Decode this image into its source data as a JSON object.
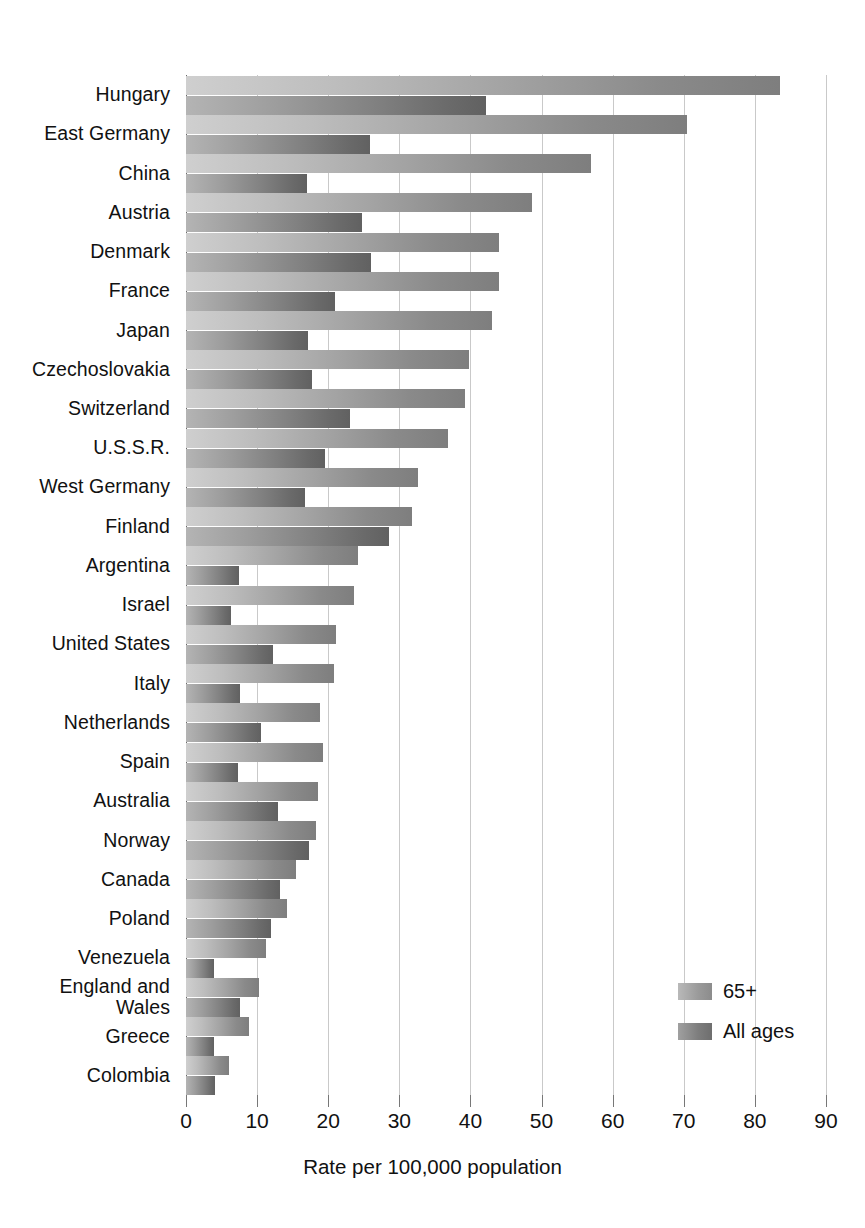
{
  "chart_data": {
    "type": "bar",
    "orientation": "horizontal",
    "title": "",
    "xlabel": "Rate per 100,000 population",
    "ylabel": "",
    "xlim": [
      0,
      90
    ],
    "xticks": [
      0,
      10,
      20,
      30,
      40,
      50,
      60,
      70,
      80,
      90
    ],
    "xtick_labels": [
      "0",
      "10",
      "20",
      "30",
      "40",
      "50",
      "60",
      "70",
      "80",
      "90"
    ],
    "grid": true,
    "legend_position": "bottom-right",
    "categories": [
      "Hungary",
      "East Germany",
      "China",
      "Austria",
      "Denmark",
      "France",
      "Japan",
      "Czechoslovakia",
      "Switzerland",
      "U.S.S.R.",
      "West Germany",
      "Finland",
      "Argentina",
      "Israel",
      "United States",
      "Italy",
      "Netherlands",
      "Spain",
      "Australia",
      "Norway",
      "Canada",
      "Poland",
      "Venezuela",
      "England and\nWales",
      "Greece",
      "Colombia"
    ],
    "series": [
      {
        "name": "65+",
        "color": "#a2a2a2",
        "values": [
          83.5,
          70.5,
          57.0,
          48.7,
          44.0,
          44.0,
          43.0,
          39.8,
          39.2,
          36.8,
          32.6,
          31.8,
          24.2,
          23.6,
          21.1,
          20.8,
          18.9,
          19.2,
          18.6,
          18.3,
          15.4,
          14.2,
          11.2,
          10.3,
          8.8,
          6.0
        ]
      },
      {
        "name": "All ages",
        "color": "#7f7f7f",
        "values": [
          42.2,
          25.9,
          17.0,
          24.8,
          26.0,
          21.0,
          17.1,
          17.7,
          23.1,
          19.5,
          16.7,
          28.6,
          7.5,
          6.3,
          12.2,
          7.6,
          10.5,
          7.3,
          12.9,
          17.3,
          13.2,
          12.0,
          4.0,
          7.6,
          4.0,
          4.1
        ]
      }
    ]
  },
  "legend": {
    "items": [
      {
        "label": "65+"
      },
      {
        "label": "All ages"
      }
    ]
  },
  "axis": {
    "x_title": "Rate per 100,000 population"
  }
}
